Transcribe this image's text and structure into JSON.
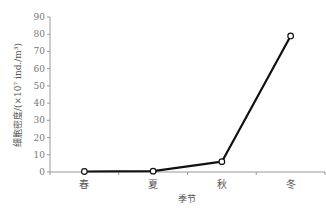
{
  "chart_data": {
    "type": "line",
    "title": "",
    "xlabel": "季节",
    "ylabel": "细胞密度/(×10⁷ ind./m³)",
    "categories": [
      "春",
      "夏",
      "秋",
      "冬"
    ],
    "series": [
      {
        "name": "细胞密度",
        "values": [
          0.3,
          0.5,
          6,
          79
        ]
      }
    ],
    "ylim": [
      0,
      90
    ],
    "yticks": [
      0,
      10,
      20,
      30,
      40,
      50,
      60,
      70,
      80,
      90
    ],
    "grid": false,
    "legend": "none",
    "marker": "open-circle",
    "line_color": "#111111"
  }
}
